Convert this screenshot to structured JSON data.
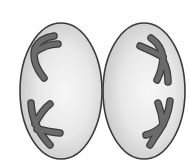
{
  "diagram": {
    "colors": {
      "background": "#ffffff",
      "cell_fill_center": "#f7f7f7",
      "cell_fill_edge": "#c4c4c4",
      "cell_outline": "#3a3a3a",
      "chromosome_fill": "#6b6b6b",
      "chromosome_outline": "#3c3c3c"
    },
    "cells": [
      {
        "id": "left-cell",
        "cx": 61,
        "cy": 91,
        "rx": 41,
        "ry": 68
      },
      {
        "id": "right-cell",
        "cx": 144,
        "cy": 91,
        "rx": 41,
        "ry": 68
      }
    ],
    "chromosomes": [
      {
        "id": "left-top",
        "cell": "left-cell",
        "paths": [
          "M 54 36 Q 40 38 35 48 Q 31 62 44 78",
          "M 35 52 Q 46 44 58 44"
        ]
      },
      {
        "id": "left-bottom",
        "cell": "left-cell",
        "paths": [
          "M 31 103 Q 32 126 50 145",
          "M 35 124 Q 42 110 50 104",
          "M 37 129 Q 50 132 60 133"
        ]
      },
      {
        "id": "right-top",
        "cell": "right-cell",
        "paths": [
          "M 140 46 Q 154 52 163 57",
          "M 151 38 Q 162 46 163 58 Q 162 70 157 80",
          "M 163 60 Q 168 70 168 82"
        ]
      },
      {
        "id": "right-bottom",
        "cell": "right-cell",
        "paths": [
          "M 158 103 Q 162 114 163 124",
          "M 170 101 Q 168 118 159 131 Q 154 138 150 145",
          "M 161 127 Q 154 133 146 135"
        ]
      }
    ]
  }
}
